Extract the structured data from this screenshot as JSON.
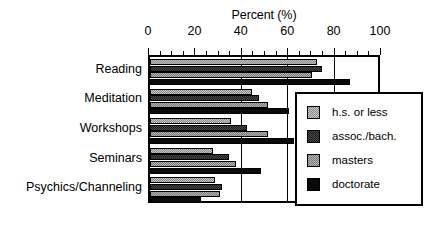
{
  "chart_data": {
    "type": "bar",
    "orientation": "horizontal",
    "title": "Percent (%)",
    "xlabel": "Percent (%)",
    "ylabel": "",
    "xlim": [
      0,
      100
    ],
    "xticks": [
      0,
      20,
      40,
      60,
      80,
      100
    ],
    "xtick_labels": [
      "0",
      "20",
      "40",
      "60",
      "80",
      "100"
    ],
    "minor_tick_interval": 4,
    "grid": true,
    "gridlines_at": [
      40,
      60,
      80
    ],
    "legend_position": "right-inside",
    "categories": [
      "Reading",
      "Meditation",
      "Workshops",
      "Seminars",
      "Psychics/Channeling"
    ],
    "series": [
      {
        "name": "h.s. or less",
        "values": [
          72,
          44,
          35,
          27,
          28
        ]
      },
      {
        "name": "assoc./bach.",
        "values": [
          74,
          47,
          42,
          34,
          31
        ]
      },
      {
        "name": "masters",
        "values": [
          70,
          51,
          51,
          37,
          30
        ]
      },
      {
        "name": "doctorate",
        "values": [
          86,
          60,
          62,
          48,
          22
        ]
      }
    ]
  },
  "legend": {
    "items": [
      {
        "label": "h.s. or less",
        "swatch": "hs-swatch-icon"
      },
      {
        "label": "assoc./bach.",
        "swatch": "assoc-swatch-icon"
      },
      {
        "label": "masters",
        "swatch": "masters-swatch-icon"
      },
      {
        "label": "doctorate",
        "swatch": "doctorate-swatch-icon"
      }
    ]
  }
}
